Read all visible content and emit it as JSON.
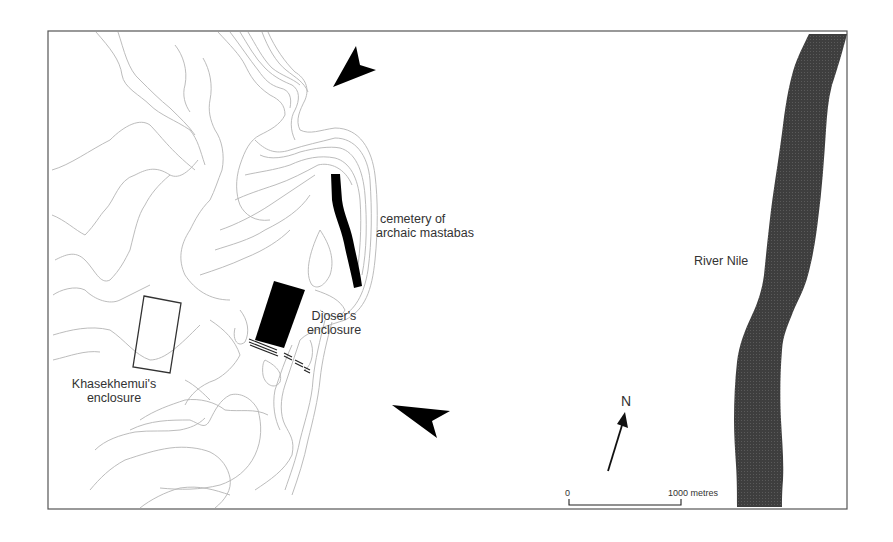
{
  "map": {
    "labels": {
      "cemetery_line1": "cemetery of",
      "cemetery_line2": "archaic mastabas",
      "djoser_line1": "Djoser's",
      "djoser_line2": "enclosure",
      "khasekhemui_line1": "Khasekhemui's",
      "khasekhemui_line2": "enclosure",
      "river": "River Nile"
    },
    "north_arrow": {
      "label": "N"
    },
    "scale_bar": {
      "start_label": "0",
      "end_label": "1000 metres"
    },
    "colors": {
      "frame": "#555555",
      "contour": "#b4b4b4",
      "river": "#3c3c3c",
      "monument": "#000000",
      "text": "#333333"
    }
  }
}
